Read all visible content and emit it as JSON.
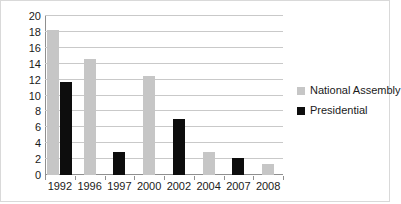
{
  "chart_data": {
    "type": "bar",
    "title": "",
    "xlabel": "",
    "ylabel": "",
    "categories": [
      "1992",
      "1996",
      "1997",
      "2000",
      "2002",
      "2004",
      "2007",
      "2008"
    ],
    "series": [
      {
        "name": "National Assembly",
        "color": "#c6c6c6",
        "values": [
          18.2,
          14.6,
          0,
          12.4,
          0,
          2.9,
          0,
          1.4
        ]
      },
      {
        "name": "Presidential",
        "color": "#0d0d0d",
        "values": [
          11.7,
          0,
          2.9,
          0,
          7.0,
          0,
          2.1,
          0
        ]
      }
    ],
    "ylim": [
      0,
      20
    ],
    "yticks": [
      0,
      2,
      4,
      6,
      8,
      10,
      12,
      14,
      16,
      18,
      20
    ],
    "ytick_labels": [
      "0",
      "2",
      "4",
      "6",
      "8",
      "10",
      "12",
      "14",
      "16",
      "18",
      "20"
    ],
    "grid": "horizontal",
    "legend_position": "right",
    "legend": [
      {
        "label": "National Assembly",
        "color": "#c6c6c6"
      },
      {
        "label": "Presidential",
        "color": "#0d0d0d"
      }
    ]
  }
}
